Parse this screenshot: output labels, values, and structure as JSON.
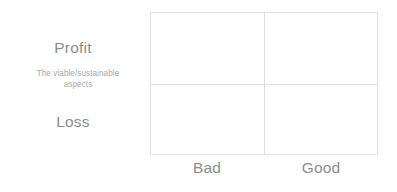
{
  "chart_data": {
    "type": "table",
    "title": "",
    "xlabel": "",
    "ylabel": "",
    "grid": true,
    "legend": "none",
    "x_categories": [
      "Bad",
      "Good"
    ],
    "y_categories": [
      "Profit",
      "Loss"
    ],
    "axis_note": "The viable/sustainable aspects",
    "cells": [
      {
        "row": "Profit",
        "column": "Bad",
        "value": ""
      },
      {
        "row": "Profit",
        "column": "Good",
        "value": ""
      },
      {
        "row": "Loss",
        "column": "Bad",
        "value": ""
      },
      {
        "row": "Loss",
        "column": "Good",
        "value": ""
      }
    ]
  },
  "matrix": {
    "y_axis": {
      "top_label": "Profit",
      "bottom_label": "Loss",
      "mid_caption_line1": "The viable/sustainable",
      "mid_caption_line2": "aspects"
    },
    "x_axis": {
      "left_label": "Bad",
      "right_label": "Good"
    },
    "colors": {
      "background": "#ffffff",
      "border": "#e3e3e6",
      "divider": "#dcdcdf",
      "label_text": "#8d8d8d",
      "caption_text": "#a8a8a8"
    }
  }
}
